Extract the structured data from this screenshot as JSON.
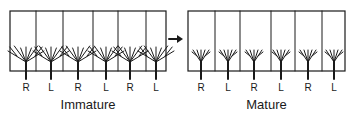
{
  "panels": [
    {
      "id": "immature",
      "caption": "Immature",
      "box": {
        "x1": 10,
        "x2": 166,
        "y1": 11,
        "y2": 71
      },
      "dividers": [
        36,
        63,
        93,
        118,
        146
      ],
      "columns": [
        {
          "label": "R",
          "stem_x": 26
        },
        {
          "label": "L",
          "stem_x": 51
        },
        {
          "label": "R",
          "stem_x": 78
        },
        {
          "label": "L",
          "stem_x": 106
        },
        {
          "label": "R",
          "stem_x": 130
        },
        {
          "label": "L",
          "stem_x": 156
        }
      ],
      "arbor_spread": 18
    },
    {
      "id": "mature",
      "caption": "Mature",
      "box": {
        "x1": 188,
        "x2": 345,
        "y1": 11,
        "y2": 71
      },
      "dividers": [
        215,
        240,
        271,
        295,
        322
      ],
      "columns": [
        {
          "label": "R",
          "stem_x": 201
        },
        {
          "label": "L",
          "stem_x": 228
        },
        {
          "label": "R",
          "stem_x": 254
        },
        {
          "label": "L",
          "stem_x": 281
        },
        {
          "label": "R",
          "stem_x": 308
        },
        {
          "label": "L",
          "stem_x": 334
        }
      ],
      "arbor_spread": 8
    }
  ],
  "arrow": {
    "x1": 169,
    "x2": 183,
    "y": 39,
    "direction": "right"
  },
  "colors": {
    "line": "#1a1a1a",
    "background": "#ffffff"
  }
}
